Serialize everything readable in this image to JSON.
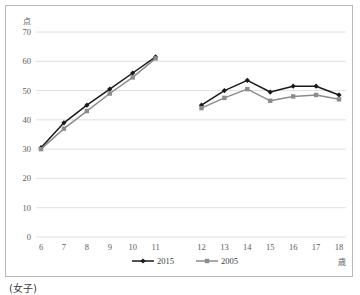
{
  "caption": "(女子)",
  "chart_data": {
    "type": "line",
    "title": "",
    "subtitle": "",
    "xlabel": "歳",
    "ylabel": "点",
    "x": [
      6,
      7,
      8,
      9,
      10,
      11,
      12,
      13,
      14,
      15,
      16,
      17,
      18
    ],
    "categories": [
      "6",
      "7",
      "8",
      "9",
      "10",
      "11",
      "12",
      "13",
      "14",
      "15",
      "16",
      "17",
      "18"
    ],
    "xtick_labels": [
      "6",
      "7",
      "8",
      "9",
      "10",
      "11",
      "12",
      "13",
      "14",
      "15",
      "16",
      "17",
      "18"
    ],
    "ytick_labels": [
      "0",
      "10",
      "20",
      "30",
      "40",
      "50",
      "60",
      "70"
    ],
    "yticks": [
      0,
      10,
      20,
      30,
      40,
      50,
      60,
      70
    ],
    "ylim": [
      0,
      70
    ],
    "grid": true,
    "legend_position": "bottom",
    "group_break_after_x": 11,
    "series": [
      {
        "name": "2015",
        "color": "#1a1a1a",
        "marker": "diamond",
        "values": [
          30.5,
          39.0,
          45.0,
          50.5,
          56.0,
          61.5,
          45.0,
          50.0,
          53.5,
          49.5,
          51.5,
          51.5,
          48.5
        ]
      },
      {
        "name": "2005",
        "color": "#8c8c8c",
        "marker": "square",
        "values": [
          30.0,
          37.0,
          43.0,
          49.0,
          54.5,
          61.0,
          44.0,
          47.5,
          50.5,
          46.5,
          48.0,
          48.5,
          47.0
        ]
      }
    ]
  },
  "legend": {
    "items": [
      {
        "label": "2015",
        "color": "#1a1a1a"
      },
      {
        "label": "2005",
        "color": "#8c8c8c"
      }
    ]
  }
}
